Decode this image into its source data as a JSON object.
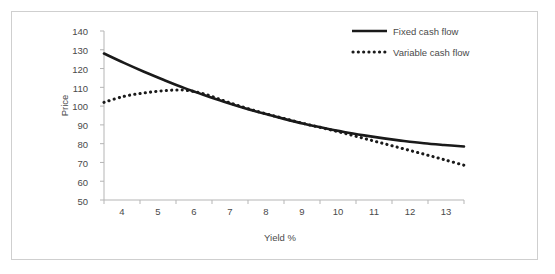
{
  "chart_data": {
    "type": "line",
    "title": "",
    "xlabel": "Yield %",
    "ylabel": "Price",
    "xlim": [
      4,
      13
    ],
    "ylim": [
      50,
      140
    ],
    "xticks": [
      "4",
      "5",
      "6",
      "7",
      "8",
      "9",
      "10",
      "11",
      "12",
      "13"
    ],
    "yticks": [
      "140",
      "130",
      "120",
      "110",
      "100",
      "90",
      "80",
      "70",
      "60",
      "50"
    ],
    "grid": false,
    "legend_position": "top-right",
    "x": [
      4,
      4.5,
      5,
      5.5,
      6,
      6.5,
      7,
      7.5,
      8,
      8.5,
      9,
      9.5,
      10,
      10.5,
      11,
      11.5,
      12,
      12.5,
      13
    ],
    "series": [
      {
        "name": "Fixed cash flow",
        "style": "solid",
        "color": "#1a1a1a",
        "values": [
          128.0,
          123.0,
          118.3,
          113.9,
          109.7,
          105.9,
          102.3,
          99.0,
          96.0,
          93.2,
          90.6,
          88.3,
          86.2,
          84.4,
          82.8,
          81.4,
          80.2,
          79.3,
          78.5
        ]
      },
      {
        "name": "Variable cash flow",
        "style": "dotted",
        "color": "#1a1a1a",
        "values": [
          102.0,
          105.2,
          107.0,
          108.2,
          108.5,
          106.5,
          102.8,
          99.3,
          96.2,
          93.4,
          90.7,
          88.2,
          85.6,
          82.8,
          80.0,
          77.2,
          74.4,
          71.5,
          68.5
        ]
      }
    ]
  },
  "legend": {
    "items": [
      {
        "label": "Fixed cash flow",
        "style": "solid"
      },
      {
        "label": "Variable cash flow",
        "style": "dotted"
      }
    ]
  },
  "axis": {
    "x_title": "Yield %",
    "y_title": "Price"
  }
}
